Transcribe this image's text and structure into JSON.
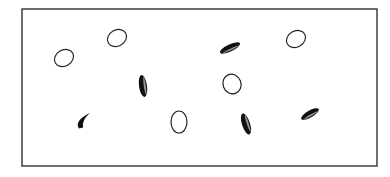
{
  "figure": {
    "frame": {
      "x": 22,
      "y": 9,
      "width": 355,
      "height": 157,
      "stroke": "#222222"
    },
    "colors": {
      "outline": "#222222",
      "fill_dark": "#111111",
      "background": "#ffffff"
    },
    "disks": [
      {
        "id": "d1",
        "kind": "open",
        "cx": 64,
        "cy": 58,
        "rx": 10,
        "ry": 8,
        "rot": -30
      },
      {
        "id": "d2",
        "kind": "open",
        "cx": 117,
        "cy": 38,
        "rx": 10,
        "ry": 8,
        "rot": -30
      },
      {
        "id": "d3",
        "kind": "dark",
        "cx": 230,
        "cy": 48,
        "rx": 11,
        "ry": 3.5,
        "rot": -25
      },
      {
        "id": "d4",
        "kind": "open",
        "cx": 296,
        "cy": 39,
        "rx": 10,
        "ry": 8,
        "rot": -30
      },
      {
        "id": "d5",
        "kind": "dark",
        "cx": 143,
        "cy": 86,
        "rx": 4,
        "ry": 11,
        "rot": -8
      },
      {
        "id": "d6",
        "kind": "open",
        "cx": 232,
        "cy": 84,
        "rx": 9,
        "ry": 10,
        "rot": -20
      },
      {
        "id": "d7",
        "kind": "curl",
        "cx": 84,
        "cy": 120,
        "rx": 9,
        "ry": 4,
        "rot": -35
      },
      {
        "id": "d8",
        "kind": "open",
        "cx": 179,
        "cy": 122,
        "rx": 8,
        "ry": 11,
        "rot": 0
      },
      {
        "id": "d9",
        "kind": "dark",
        "cx": 246,
        "cy": 124,
        "rx": 4,
        "ry": 11,
        "rot": -18
      },
      {
        "id": "d10",
        "kind": "dark",
        "cx": 310,
        "cy": 114,
        "rx": 10,
        "ry": 3.5,
        "rot": -30
      }
    ]
  }
}
